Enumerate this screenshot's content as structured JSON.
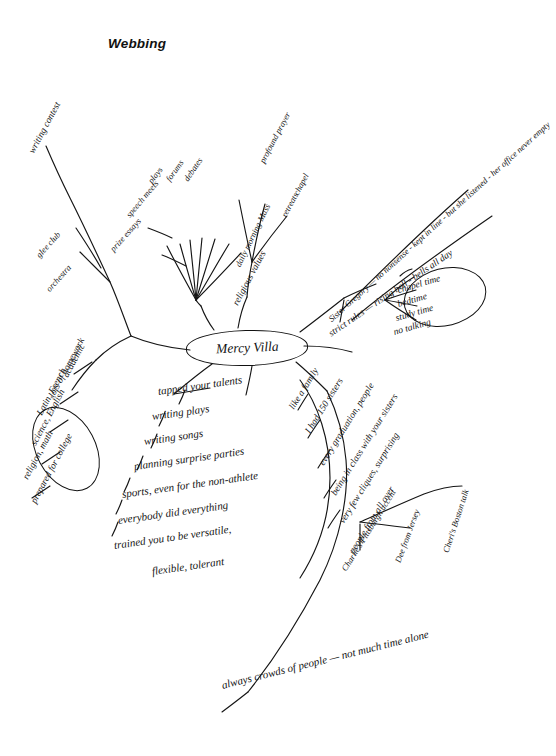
{
  "page": {
    "title": "Webbing",
    "center": "Mercy Villa",
    "footer_note": "always crowds of people — not much time alone"
  },
  "branches": {
    "religion": {
      "label": "religious values",
      "children": [
        "daily morning Mass",
        "retreats",
        "chapel",
        "profound prayer"
      ]
    },
    "writing": {
      "label": "writing contest"
    },
    "activities_fan": {
      "items": [
        "plays",
        "forums",
        "debates",
        "speech meets",
        "prize essays",
        "glee club",
        "orchestra"
      ]
    },
    "strict_rules": {
      "label": "strict rules — rising bell - bells all day",
      "children": [
        "chapel time",
        "bedtime",
        "study time",
        "no talking"
      ]
    },
    "sister_gregory": {
      "label": "Sister Gregory — no nonsense - kept in line - but she listened - her office never empty"
    },
    "family": {
      "label": "like a family",
      "children": [
        "I had 150 sisters",
        "every graduation, people",
        "being in class with your sisters",
        "very few cliques, surprising",
        "people from all over"
      ],
      "accents": [
        "Charlie's Pittsburgh accent",
        "Dee from Jersey",
        "Cheri's Boston talk"
      ]
    },
    "talents": {
      "items": [
        "tapped your talents",
        "writing plays",
        "writing songs",
        "planning surprise parties",
        "sports, even for the non-athlete",
        "everybody did everything",
        "trained you to be versatile,",
        "flexible, tolerant"
      ]
    },
    "academic": {
      "label": "academic",
      "items": [
        "lots of homework",
        "Latin, French",
        "science, English",
        "religion, math",
        "prepared for college"
      ]
    }
  }
}
